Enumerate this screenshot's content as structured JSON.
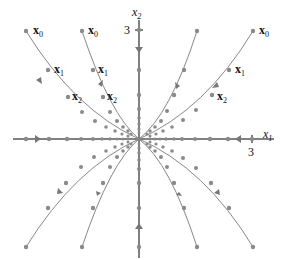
{
  "diagram": {
    "axes": {
      "x_label": "x",
      "x_label_sub": "1",
      "y_label": "x",
      "y_label_sub": "2",
      "x_tick": "3",
      "y_tick": "3"
    },
    "point_labels": [
      {
        "text": "x",
        "sub": "0"
      },
      {
        "text": "x",
        "sub": "1"
      },
      {
        "text": "x",
        "sub": "2"
      }
    ],
    "colors": {
      "axis": "#000000",
      "trajectory": "#777777",
      "point": "#888888"
    }
  }
}
